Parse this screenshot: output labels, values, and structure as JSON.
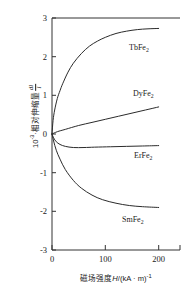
{
  "figure": {
    "title": "",
    "y_axis_label_prefix": "10",
    "y_axis_label_exponent": "-3",
    "y_axis_label_middle": "·相对伸缩量",
    "y_axis_frac_numerator": "dl",
    "y_axis_frac_denominator": "l",
    "x_axis_label_cn": "磁场强度",
    "x_axis_label_sym": "H",
    "x_axis_label_unit": "/(kA · m)",
    "x_axis_label_unit_exp": "-1"
  },
  "chart_data": {
    "type": "line",
    "title": "",
    "xlabel": "磁场强度H/(kA · m)-1",
    "ylabel": "10-3·相对伸缩量 dl/l",
    "xlim": [
      0,
      240
    ],
    "ylim": [
      -3,
      3
    ],
    "grid": false,
    "legend_position": "inline-labels",
    "xticks": [
      0,
      100,
      200
    ],
    "xticklabels": [
      "0",
      "100",
      "200"
    ],
    "yticks": [
      -3,
      -2,
      -1,
      0,
      1,
      2,
      3
    ],
    "yticklabels": [
      "-3",
      "-2",
      "-1",
      "0",
      "1",
      "2",
      "3"
    ],
    "series": [
      {
        "name": "TbFe2",
        "label": "TbFe",
        "label_sub": "2",
        "label_x": 145,
        "label_y": 2.25,
        "x": [
          0,
          2,
          5,
          10,
          15,
          20,
          30,
          40,
          55,
          70,
          85,
          100,
          120,
          140,
          160,
          180,
          200
        ],
        "values": [
          0,
          0.35,
          0.62,
          0.92,
          1.12,
          1.3,
          1.6,
          1.83,
          2.08,
          2.27,
          2.4,
          2.5,
          2.6,
          2.66,
          2.7,
          2.72,
          2.73
        ]
      },
      {
        "name": "DyFe2",
        "label": "DyFe",
        "label_sub": "2",
        "label_x": 148,
        "label_y": 1.08,
        "x": [
          0,
          10,
          25,
          50,
          75,
          100,
          125,
          150,
          175,
          200
        ],
        "values": [
          0,
          0.06,
          0.12,
          0.22,
          0.3,
          0.38,
          0.46,
          0.54,
          0.62,
          0.7
        ]
      },
      {
        "name": "ErFe2",
        "label": "ErFe",
        "label_sub": "2",
        "label_x": 148,
        "label_y": -0.62,
        "x": [
          0,
          3,
          8,
          15,
          25,
          40,
          60,
          80,
          110,
          140,
          170,
          200
        ],
        "values": [
          0,
          -0.1,
          -0.2,
          -0.27,
          -0.32,
          -0.35,
          -0.35,
          -0.34,
          -0.33,
          -0.32,
          -0.31,
          -0.3
        ]
      },
      {
        "name": "SmFe2",
        "label": "SmFe",
        "label_sub": "2",
        "label_x": 135,
        "label_y": -2.3,
        "x": [
          0,
          3,
          8,
          15,
          25,
          40,
          55,
          75,
          95,
          120,
          145,
          170,
          200
        ],
        "values": [
          0,
          -0.18,
          -0.42,
          -0.65,
          -0.92,
          -1.2,
          -1.4,
          -1.58,
          -1.7,
          -1.79,
          -1.85,
          -1.88,
          -1.9
        ]
      }
    ]
  }
}
